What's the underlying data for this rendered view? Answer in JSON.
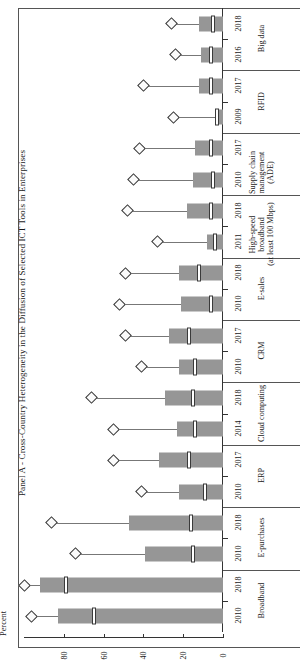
{
  "figure": {
    "title": "Panel A - Cross-Country Heterogeneity in the Diffusion of Selected ICT Tools in Enterprises",
    "axis_title": "Percent"
  },
  "axis": {
    "ticks": [
      {
        "value": 0,
        "label": "0"
      },
      {
        "value": 20,
        "label": "20"
      },
      {
        "value": 40,
        "label": "40"
      },
      {
        "value": 60,
        "label": "60"
      },
      {
        "value": 80,
        "label": "80"
      }
    ]
  },
  "chart_data": {
    "type": "bar",
    "title": "Panel A - Cross-Country Heterogeneity in the Diffusion of Selected ICT Tools in Enterprises",
    "orientation": "horizontal",
    "xlabel": "Percent",
    "ylabel": "",
    "xlim": [
      0,
      100
    ],
    "grid": false,
    "legend": "none",
    "note": "Each observation is a box (cross-country interquartile range) with a white median marker, a whisker line and a diamond marker at the maximum country value.",
    "categories": [
      "Broadband",
      "E-purchases",
      "ERP",
      "Cloud computing",
      "CRM",
      "E-sales",
      "High-speed broadband (at least 100 Mbps)",
      "Supply chain management (ADE)",
      "RFID",
      "Big data"
    ],
    "observations": [
      {
        "category": "Broadband",
        "year": "2010",
        "box_low": 0,
        "box_high": 83,
        "median": 65,
        "max": 96
      },
      {
        "category": "Broadband",
        "year": "2018",
        "box_low": 0,
        "box_high": 92,
        "median": 79,
        "max": 100
      },
      {
        "category": "E-purchases",
        "year": "2010",
        "box_low": 0,
        "box_high": 39,
        "median": 15,
        "max": 74
      },
      {
        "category": "E-purchases",
        "year": "2018",
        "box_low": 0,
        "box_high": 47,
        "median": 16,
        "max": 86
      },
      {
        "category": "ERP",
        "year": "2010",
        "box_low": 0,
        "box_high": 22,
        "median": 9,
        "max": 41
      },
      {
        "category": "ERP",
        "year": "2017",
        "box_low": 0,
        "box_high": 32,
        "median": 17,
        "max": 55
      },
      {
        "category": "Cloud computing",
        "year": "2014",
        "box_low": 0,
        "box_high": 23,
        "median": 14,
        "max": 55
      },
      {
        "category": "Cloud computing",
        "year": "2018",
        "box_low": 0,
        "box_high": 29,
        "median": 15,
        "max": 66
      },
      {
        "category": "CRM",
        "year": "2010",
        "box_low": 0,
        "box_high": 22,
        "median": 14,
        "max": 41
      },
      {
        "category": "CRM",
        "year": "2017",
        "box_low": 0,
        "box_high": 27,
        "median": 17,
        "max": 49
      },
      {
        "category": "E-sales",
        "year": "2010",
        "box_low": 0,
        "box_high": 21,
        "median": 6,
        "max": 52
      },
      {
        "category": "E-sales",
        "year": "2018",
        "box_low": 0,
        "box_high": 22,
        "median": 12,
        "max": 49
      },
      {
        "category": "High-speed broadband (at least 100 Mbps)",
        "year": "2011",
        "box_low": 0,
        "box_high": 8,
        "median": 4,
        "max": 33
      },
      {
        "category": "High-speed broadband (at least 100 Mbps)",
        "year": "2018",
        "box_low": 0,
        "box_high": 18,
        "median": 6,
        "max": 48
      },
      {
        "category": "Supply chain management (ADE)",
        "year": "2010",
        "box_low": 0,
        "box_high": 15,
        "median": 5,
        "max": 45
      },
      {
        "category": "Supply chain management (ADE)",
        "year": "2017",
        "box_low": 0,
        "box_high": 14,
        "median": 6,
        "max": 42
      },
      {
        "category": "RFID",
        "year": "2009",
        "box_low": 0,
        "box_high": 4,
        "median": 3,
        "max": 25
      },
      {
        "category": "RFID",
        "year": "2017",
        "box_low": 0,
        "box_high": 12,
        "median": 6,
        "max": 40
      },
      {
        "category": "Big data",
        "year": "2016",
        "box_low": 0,
        "box_high": 11,
        "median": 6,
        "max": 24
      },
      {
        "category": "Big data",
        "year": "2018",
        "box_low": 0,
        "box_high": 12,
        "median": 5,
        "max": 26
      }
    ]
  },
  "colors": {
    "box_fill": "#969696",
    "median_fill": "#ffffff",
    "marker_edge": "#333333",
    "axis": "#333333"
  }
}
